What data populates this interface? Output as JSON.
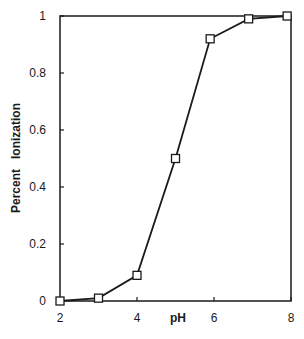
{
  "chart_data": {
    "type": "line",
    "title": "",
    "xlabel": "pH",
    "ylabel": "Percent   Ionization",
    "xlim": [
      2,
      8
    ],
    "ylim": [
      0,
      1
    ],
    "grid": false,
    "legend": null,
    "x_ticks": [
      2,
      4,
      6,
      8
    ],
    "x_tick_labels": [
      "2",
      "4",
      "6",
      "8"
    ],
    "y_ticks": [
      0,
      0.2,
      0.4,
      0.6,
      0.8,
      1
    ],
    "y_tick_labels": [
      "0",
      "0.2",
      "0.4",
      "0.6",
      "0.8",
      "1"
    ],
    "series": [
      {
        "name": "Percent Ionization",
        "marker": "open-square",
        "color": "#1a1a1a",
        "x": [
          2,
          3,
          4,
          5,
          5.9,
          6.9,
          7.9
        ],
        "y": [
          0.0,
          0.01,
          0.09,
          0.5,
          0.92,
          0.99,
          1.0
        ]
      }
    ]
  },
  "colors": {
    "line": "#1a1a1a",
    "background": "#ffffff"
  }
}
